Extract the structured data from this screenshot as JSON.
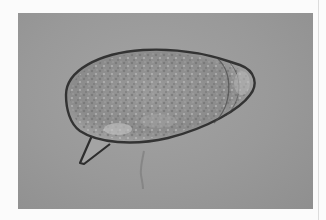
{
  "image": {
    "subject": "Parasite egg with lateral spine (light micrograph)",
    "description": "Oval egg containing granular miracidium with a sharp lateral spine projecting downward-left",
    "colors": {
      "page_background": "#fbfbfb",
      "field_background": "#999999",
      "egg_shell": "#3a3a3a",
      "egg_interior": "#8a8a8a",
      "egg_highlight": "#c4c4c4",
      "spine": "#2e2e2e",
      "filament": "#7a7a7a"
    }
  }
}
